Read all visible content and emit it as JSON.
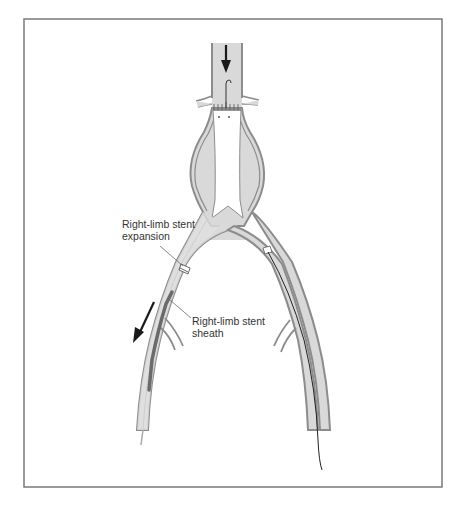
{
  "figure": {
    "frame_color": "#7a7a7a",
    "vessel_wall_color": "#8c8c8c",
    "vessel_fill_color": "#d9d9d9",
    "lumen_color": "#ffffff",
    "arrow_color": "#1a1a1a"
  },
  "labels": {
    "expansion": {
      "line1": "Right-limb stent",
      "line2": "expansion"
    },
    "sheath": {
      "line1": "Right-limb stent",
      "line2": "sheath"
    }
  },
  "arrows": [
    {
      "name": "blood-flow-arrow",
      "direction": "down"
    },
    {
      "name": "sheath-withdrawal-arrow",
      "direction": "down-left"
    }
  ]
}
